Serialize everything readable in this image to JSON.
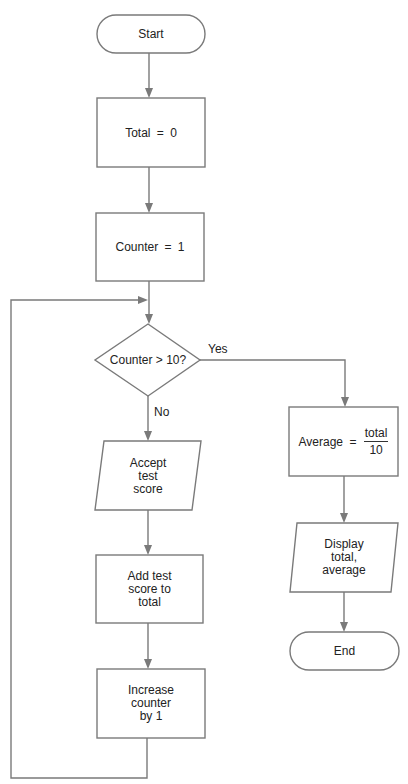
{
  "flowchart": {
    "start": {
      "label": "Start"
    },
    "init_total": {
      "label": "Total = 0"
    },
    "init_counter": {
      "label": "Counter = 1"
    },
    "decision": {
      "label": "Counter > 10?",
      "yes_label": "Yes",
      "no_label": "No"
    },
    "accept": {
      "label": "Accept\ntest\nscore"
    },
    "add": {
      "label": "Add test\nscore to\ntotal"
    },
    "increase": {
      "label": "Increase\ncounter\nby 1"
    },
    "average": {
      "label_prefix": "Average =",
      "numerator": "total",
      "denominator": "10"
    },
    "display": {
      "label": "Display\ntotal,\naverage"
    },
    "end": {
      "label": "End"
    }
  },
  "colors": {
    "stroke": "#7a7a7a",
    "text": "#222222",
    "background": "#ffffff"
  }
}
